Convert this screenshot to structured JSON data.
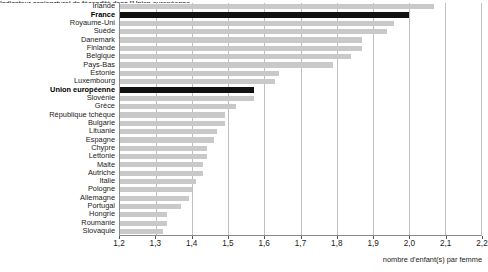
{
  "title_clipped": "Indicateur conjoncturel de fécondité dans l'Union européenne",
  "xaxis": {
    "caption": "nombre d'enfant(s) par femme",
    "min": 1.2,
    "max": 2.2,
    "ticks": [
      "1,2",
      "1,3",
      "1,4",
      "1,5",
      "1,6",
      "1,7",
      "1,8",
      "1,9",
      "2,0",
      "2,1",
      "2,2"
    ]
  },
  "colors": {
    "bar": "#c9c9c9",
    "bar_highlight": "#111111",
    "grid": "#d8d8d8",
    "axis": "#8a8a8a"
  },
  "chart_data": {
    "type": "bar",
    "orientation": "horizontal",
    "title": "Indicateur conjoncturel de fécondité dans l'Union européenne",
    "xlabel": "nombre d'enfant(s) par femme",
    "ylabel": "",
    "xlim": [
      1.2,
      2.2
    ],
    "grid": true,
    "legend": "none",
    "categories": [
      "Irlande",
      "France",
      "Royaume-Uni",
      "Suède",
      "Danemark",
      "Finlande",
      "Belgique",
      "Pays-Bas",
      "Estonie",
      "Luxembourg",
      "Union européenne",
      "Slovénie",
      "Grèce",
      "République tchèque",
      "Bulgarie",
      "Lituanie",
      "Espagne",
      "Chypre",
      "Lettonie",
      "Malte",
      "Autriche",
      "Italie",
      "Pologne",
      "Allemagne",
      "Portugal",
      "Hongrie",
      "Roumanie",
      "Slovaquie"
    ],
    "values": [
      2.07,
      2.0,
      1.96,
      1.94,
      1.87,
      1.87,
      1.84,
      1.79,
      1.64,
      1.63,
      1.57,
      1.57,
      1.52,
      1.49,
      1.49,
      1.47,
      1.46,
      1.44,
      1.44,
      1.43,
      1.43,
      1.41,
      1.4,
      1.39,
      1.37,
      1.33,
      1.33,
      1.32
    ],
    "highlighted": [
      "France",
      "Union européenne"
    ]
  }
}
